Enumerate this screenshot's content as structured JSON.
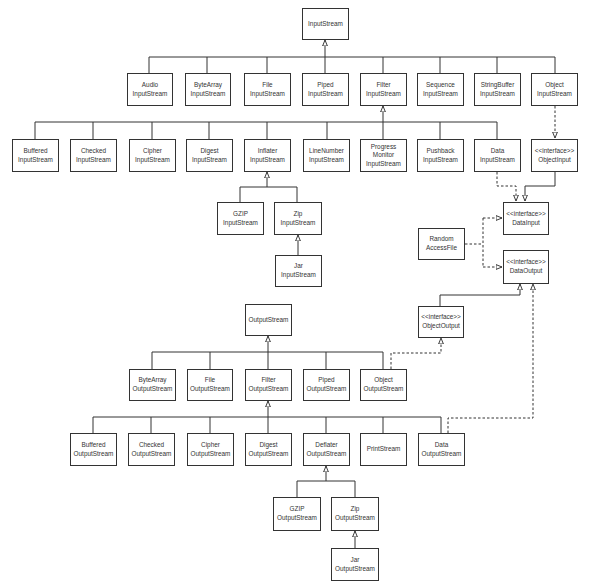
{
  "colors": {
    "line": "#333333",
    "box_border": "#333333",
    "background": "#ffffff",
    "text": "#333333"
  },
  "input_hierarchy": {
    "root": {
      "id": "InputStream",
      "lines": [
        "InputStream"
      ]
    },
    "level1": [
      {
        "id": "AudioInputStream",
        "lines": [
          "Audio",
          "InputStream"
        ]
      },
      {
        "id": "ByteArrayInputStream",
        "lines": [
          "ByteArray",
          "InputStream"
        ]
      },
      {
        "id": "FileInputStream",
        "lines": [
          "File",
          "InputStream"
        ]
      },
      {
        "id": "PipedInputStream",
        "lines": [
          "Piped",
          "InputStream"
        ]
      },
      {
        "id": "FilterInputStream",
        "lines": [
          "Filter",
          "InputStream"
        ]
      },
      {
        "id": "SequenceInputStream",
        "lines": [
          "Sequence",
          "InputStream"
        ]
      },
      {
        "id": "StringBufferInputStream",
        "lines": [
          "StringBuffer",
          "InputStream"
        ]
      },
      {
        "id": "ObjectInputStream",
        "lines": [
          "Object",
          "InputStream"
        ]
      }
    ],
    "filter_children": [
      {
        "id": "BufferedInputStream",
        "lines": [
          "Buffered",
          "InputStream"
        ]
      },
      {
        "id": "CheckedInputStream",
        "lines": [
          "Checked",
          "InputStream"
        ]
      },
      {
        "id": "CipherInputStream",
        "lines": [
          "Cipher",
          "InputStream"
        ]
      },
      {
        "id": "DigestInputStream",
        "lines": [
          "Digest",
          "InputStream"
        ]
      },
      {
        "id": "InflaterInputStream",
        "lines": [
          "Inflater",
          "InputStream"
        ]
      },
      {
        "id": "LineNumberInputStream",
        "lines": [
          "LineNumber",
          "InputStream"
        ]
      },
      {
        "id": "ProgressMonitorInputStream",
        "lines": [
          "Progress",
          "Monitor",
          "InputStream"
        ]
      },
      {
        "id": "PushbackInputStream",
        "lines": [
          "Pushback",
          "InputStream"
        ]
      },
      {
        "id": "DataInputStream",
        "lines": [
          "Data",
          "InputStream"
        ]
      }
    ],
    "inflater_children": [
      {
        "id": "GZIPInputStream",
        "lines": [
          "GZIP",
          "InputStream"
        ]
      },
      {
        "id": "ZipInputStream",
        "lines": [
          "Zip",
          "InputStream"
        ]
      }
    ],
    "zip_children": [
      {
        "id": "JarInputStream",
        "lines": [
          "Jar",
          "InputStream"
        ]
      }
    ]
  },
  "interfaces": {
    "ObjectInput": {
      "lines": [
        "<<interface>>",
        "ObjectInput"
      ]
    },
    "DataInput": {
      "lines": [
        "<<interface>>",
        "DataInput"
      ]
    },
    "DataOutput": {
      "lines": [
        "<<interface>>",
        "DataOutput"
      ]
    },
    "ObjectOutput": {
      "lines": [
        "<<interface>>",
        "ObjectOutput"
      ]
    }
  },
  "other_classes": {
    "RandomAccessFile": {
      "lines": [
        "Random",
        "AccessFile"
      ]
    }
  },
  "output_hierarchy": {
    "root": {
      "id": "OutputStream",
      "lines": [
        "OutputStream"
      ]
    },
    "level1": [
      {
        "id": "ByteArrayOutputStream",
        "lines": [
          "ByteArray",
          "OutputStream"
        ]
      },
      {
        "id": "FileOutputStream",
        "lines": [
          "File",
          "OutputStream"
        ]
      },
      {
        "id": "FilterOutputStream",
        "lines": [
          "Filter",
          "OutputStream"
        ]
      },
      {
        "id": "PipedOutputStream",
        "lines": [
          "Piped",
          "OutputStream"
        ]
      },
      {
        "id": "ObjectOutputStream",
        "lines": [
          "Object",
          "OutputStream"
        ]
      }
    ],
    "filter_children": [
      {
        "id": "BufferedOutputStream",
        "lines": [
          "Buffered",
          "OutputStream"
        ]
      },
      {
        "id": "CheckedOutputStream",
        "lines": [
          "Checked",
          "OutputStream"
        ]
      },
      {
        "id": "CipherOutputStream",
        "lines": [
          "Cipher",
          "OutputStream"
        ]
      },
      {
        "id": "DigestOutputStream",
        "lines": [
          "Digest",
          "OutputStream"
        ]
      },
      {
        "id": "DeflaterOutputStream",
        "lines": [
          "Deflater",
          "OutputStream"
        ]
      },
      {
        "id": "PrintStream",
        "lines": [
          "PrintStream"
        ]
      },
      {
        "id": "DataOutputStream",
        "lines": [
          "Data",
          "OutputStream"
        ]
      }
    ],
    "deflater_children": [
      {
        "id": "GZIPOutputStream",
        "lines": [
          "GZIP",
          "OutputStream"
        ]
      },
      {
        "id": "ZipOutputStream",
        "lines": [
          "Zip",
          "OutputStream"
        ]
      }
    ],
    "zip_children": [
      {
        "id": "JarOutputStream",
        "lines": [
          "Jar",
          "OutputStream"
        ]
      }
    ]
  },
  "relationships": {
    "inheritance": [
      [
        "AudioInputStream",
        "InputStream"
      ],
      [
        "ByteArrayInputStream",
        "InputStream"
      ],
      [
        "FileInputStream",
        "InputStream"
      ],
      [
        "PipedInputStream",
        "InputStream"
      ],
      [
        "FilterInputStream",
        "InputStream"
      ],
      [
        "SequenceInputStream",
        "InputStream"
      ],
      [
        "StringBufferInputStream",
        "InputStream"
      ],
      [
        "ObjectInputStream",
        "InputStream"
      ],
      [
        "BufferedInputStream",
        "FilterInputStream"
      ],
      [
        "CheckedInputStream",
        "FilterInputStream"
      ],
      [
        "CipherInputStream",
        "FilterInputStream"
      ],
      [
        "DigestInputStream",
        "FilterInputStream"
      ],
      [
        "InflaterInputStream",
        "FilterInputStream"
      ],
      [
        "LineNumberInputStream",
        "FilterInputStream"
      ],
      [
        "ProgressMonitorInputStream",
        "FilterInputStream"
      ],
      [
        "PushbackInputStream",
        "FilterInputStream"
      ],
      [
        "DataInputStream",
        "FilterInputStream"
      ],
      [
        "GZIPInputStream",
        "InflaterInputStream"
      ],
      [
        "ZipInputStream",
        "InflaterInputStream"
      ],
      [
        "JarInputStream",
        "ZipInputStream"
      ],
      [
        "ObjectInput",
        "DataInput"
      ],
      [
        "ObjectOutput",
        "DataOutput"
      ],
      [
        "ByteArrayOutputStream",
        "OutputStream"
      ],
      [
        "FileOutputStream",
        "OutputStream"
      ],
      [
        "FilterOutputStream",
        "OutputStream"
      ],
      [
        "PipedOutputStream",
        "OutputStream"
      ],
      [
        "ObjectOutputStream",
        "OutputStream"
      ],
      [
        "BufferedOutputStream",
        "FilterOutputStream"
      ],
      [
        "CheckedOutputStream",
        "FilterOutputStream"
      ],
      [
        "CipherOutputStream",
        "FilterOutputStream"
      ],
      [
        "DigestOutputStream",
        "FilterOutputStream"
      ],
      [
        "DeflaterOutputStream",
        "FilterOutputStream"
      ],
      [
        "PrintStream",
        "FilterOutputStream"
      ],
      [
        "DataOutputStream",
        "FilterOutputStream"
      ],
      [
        "GZIPOutputStream",
        "DeflaterOutputStream"
      ],
      [
        "ZipOutputStream",
        "DeflaterOutputStream"
      ],
      [
        "JarOutputStream",
        "ZipOutputStream"
      ]
    ],
    "implements": [
      [
        "ObjectInputStream",
        "ObjectInput"
      ],
      [
        "DataInputStream",
        "DataInput"
      ],
      [
        "RandomAccessFile",
        "DataInput"
      ],
      [
        "RandomAccessFile",
        "DataOutput"
      ],
      [
        "ObjectOutputStream",
        "ObjectOutput"
      ],
      [
        "DataOutputStream",
        "DataOutput"
      ]
    ]
  }
}
